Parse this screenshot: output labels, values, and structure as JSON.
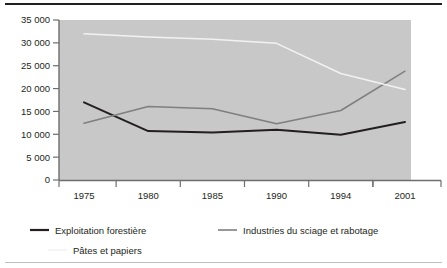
{
  "chart_data": {
    "type": "line",
    "title": "",
    "subtitle": "",
    "xlabel": "",
    "ylabel": "",
    "categories": [
      "1975",
      "1980",
      "1985",
      "1990",
      "1994",
      "2001"
    ],
    "ylim": [
      0,
      35000
    ],
    "yticks": [
      "0",
      "5 000",
      "10 000",
      "15 000",
      "20 000",
      "25 000",
      "30 000",
      "35 000"
    ],
    "ytick_values": [
      0,
      5000,
      10000,
      15000,
      20000,
      25000,
      30000,
      35000
    ],
    "grid": false,
    "legend_position": "bottom",
    "plot_background": "#c8c8c8",
    "series": [
      {
        "name": "Exploitation forestière",
        "color": "#231f20",
        "values": [
          17000,
          10700,
          10400,
          11000,
          9900,
          12700
        ]
      },
      {
        "name": "Industries du sciage et rabotage",
        "color": "#7f7f7f",
        "values": [
          12400,
          16100,
          15600,
          12300,
          15200,
          23800
        ]
      },
      {
        "name": "Pâtes et papiers",
        "color": "#f2f2f2",
        "values": [
          32000,
          31300,
          30800,
          29900,
          23300,
          19800
        ]
      }
    ]
  },
  "axis": {
    "y_labels": [
      "35 000",
      "30 000",
      "25 000",
      "20 000",
      "15 000",
      "10 000",
      "5 000",
      "0"
    ],
    "x_labels": [
      "1975",
      "1980",
      "1985",
      "1990",
      "1994",
      "2001"
    ]
  },
  "legend": {
    "items": [
      {
        "label": "Exploitation forestière",
        "color": "#231f20"
      },
      {
        "label": "Industries du sciage et rabotage",
        "color": "#7f7f7f"
      },
      {
        "label": "Pâtes et papiers",
        "color": "#f2f2f2"
      }
    ]
  }
}
